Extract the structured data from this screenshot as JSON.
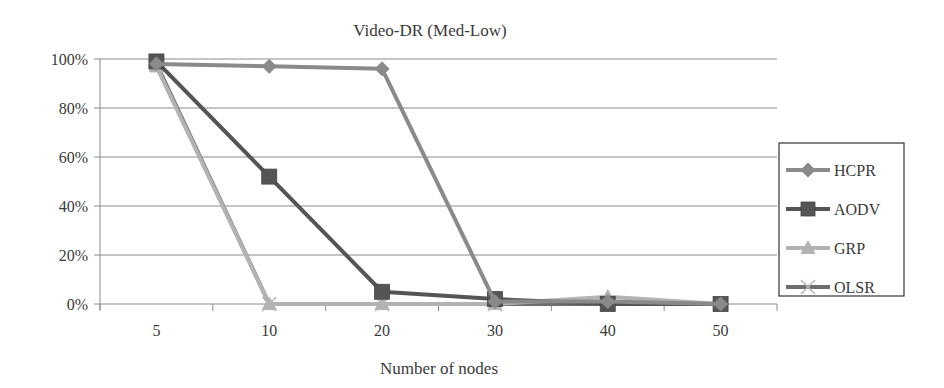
{
  "chart_data": {
    "type": "line",
    "title": "Video-DR (Med-Low)",
    "xlabel": "Number of nodes",
    "ylabel": "",
    "categories": [
      "5",
      "10",
      "20",
      "30",
      "40",
      "50"
    ],
    "y_ticks": [
      "0%",
      "20%",
      "40%",
      "60%",
      "80%",
      "100%"
    ],
    "ylim": [
      0,
      100
    ],
    "grid": true,
    "legend_position": "right",
    "series": [
      {
        "name": "HCPR",
        "marker": "diamond",
        "color": "#8a8a8a",
        "values": [
          98,
          97,
          96,
          1,
          1,
          0
        ]
      },
      {
        "name": "AODV",
        "marker": "square",
        "color": "#555555",
        "values": [
          99,
          52,
          5,
          2,
          0,
          0
        ]
      },
      {
        "name": "GRP",
        "marker": "triangle",
        "color": "#b3b3b3",
        "values": [
          97,
          0,
          0,
          0,
          3,
          0
        ]
      },
      {
        "name": "OLSR",
        "marker": "x",
        "color": "#6e6e6e",
        "values": [
          98,
          0,
          0,
          0,
          0,
          0
        ]
      }
    ]
  }
}
